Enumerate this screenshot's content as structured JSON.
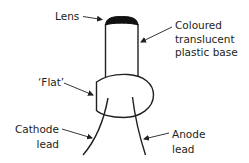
{
  "diagram": {
    "labels": {
      "lens": "Lens",
      "base": [
        "Coloured",
        "translucent",
        "plastic base"
      ],
      "flat": "‘Flat’",
      "cathode": [
        "Cathode",
        "lead"
      ],
      "anode": [
        "Anode",
        "lead"
      ]
    },
    "colors": {
      "stroke": "#231f20",
      "lens_fill": "#111111",
      "background": "#ffffff"
    }
  }
}
